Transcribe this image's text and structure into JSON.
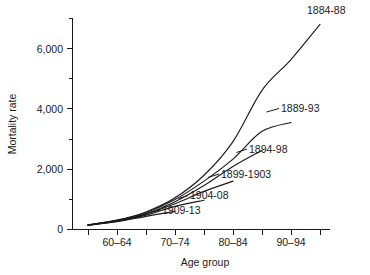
{
  "chart_data": {
    "type": "line",
    "title": "",
    "xlabel": "Age group",
    "ylabel": "Mortality rate",
    "grid": false,
    "legend_position": "inline-right-of-curve-end",
    "x": [
      "55-59",
      "60-64",
      "65-69",
      "70-74",
      "75-79",
      "80-84",
      "85-89",
      "90-94",
      "95-99"
    ],
    "xtick_labels": [
      "60–64",
      "70–74",
      "80–84",
      "90–94"
    ],
    "xtick_values": [
      "60-64",
      "70-74",
      "80-84",
      "90-94"
    ],
    "ylim": [
      0,
      7200
    ],
    "ytick_labels": [
      "0",
      "2,000",
      "4,000",
      "6,000"
    ],
    "ytick_values": [
      0,
      2000,
      4000,
      6000
    ],
    "yminor_values": [
      1000,
      3000,
      5000,
      7000
    ],
    "series": [
      {
        "name": "1884-88",
        "label": "1884-88",
        "x": [
          "55-59",
          "60-64",
          "65-69",
          "70-74",
          "75-79",
          "80-84",
          "85-89",
          "90-94",
          "95-99"
        ],
        "values": [
          160,
          320,
          600,
          1080,
          1850,
          3000,
          4750,
          5800,
          7000
        ]
      },
      {
        "name": "1889-93",
        "label": "1889-93",
        "x": [
          "55-59",
          "60-64",
          "65-69",
          "70-74",
          "75-79",
          "80-84",
          "85-89",
          "90-94"
        ],
        "values": [
          160,
          310,
          570,
          1020,
          1650,
          2400,
          3350,
          3650
        ]
      },
      {
        "name": "1894-98",
        "label": "1894-98",
        "x": [
          "55-59",
          "60-64",
          "65-69",
          "70-74",
          "75-79",
          "80-84",
          "85-89"
        ],
        "values": [
          155,
          300,
          540,
          950,
          1500,
          2150,
          2700
        ]
      },
      {
        "name": "1899-1903",
        "label": "1899-1903",
        "x": [
          "55-59",
          "60-64",
          "65-69",
          "70-74",
          "75-79",
          "80-84"
        ],
        "values": [
          150,
          290,
          520,
          880,
          1300,
          1650
        ]
      },
      {
        "name": "1904-08",
        "label": "1904-08",
        "x": [
          "55-59",
          "60-64",
          "65-69",
          "70-74",
          "75-79"
        ],
        "values": [
          150,
          280,
          490,
          790,
          1000
        ]
      },
      {
        "name": "1909-13",
        "label": "1909-13",
        "x": [
          "55-59",
          "60-64",
          "65-69",
          "70-74"
        ],
        "values": [
          145,
          265,
          450,
          620
        ]
      }
    ],
    "colors": {
      "line": "#1a1a1a",
      "axis": "#1a1a1a",
      "background": "#ffffff"
    }
  }
}
